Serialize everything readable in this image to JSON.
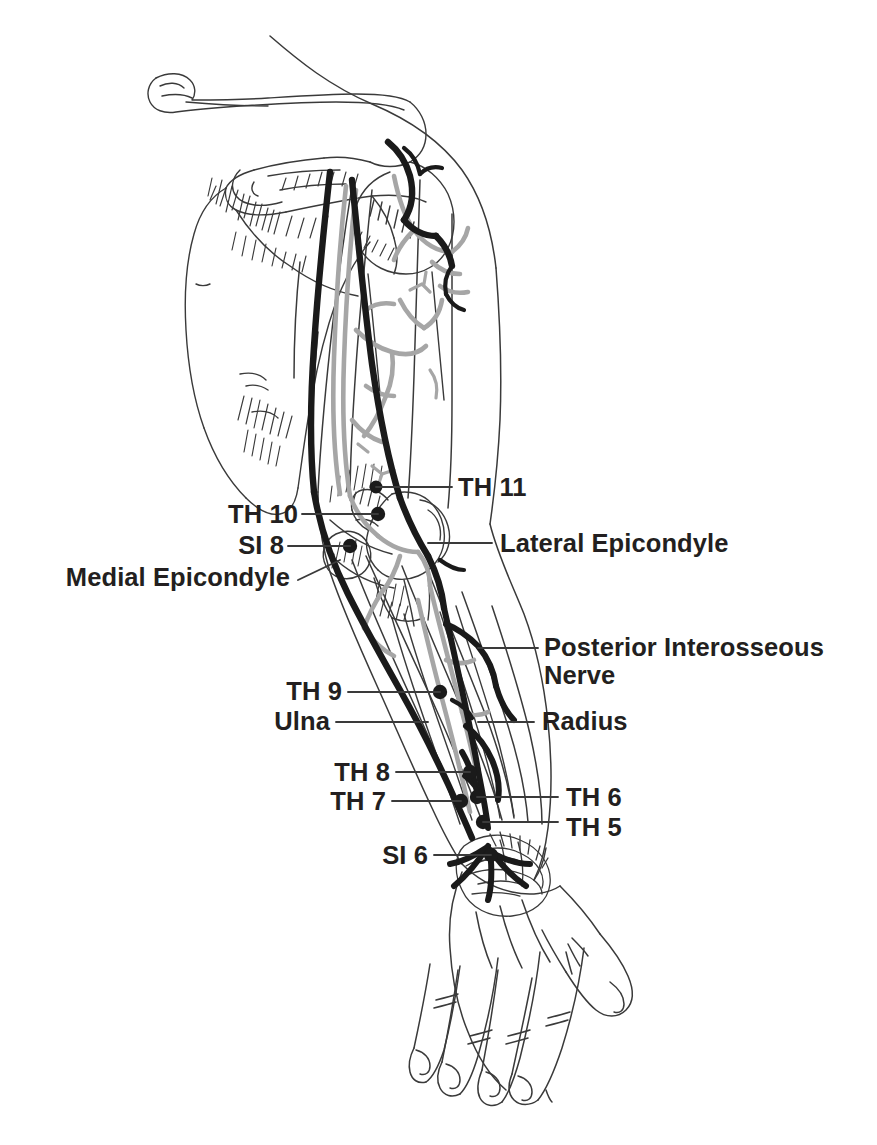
{
  "figure": {
    "view": "posterior",
    "colors": {
      "outline": "#3a3a3a",
      "nerve": "#1a1a1a",
      "vessel": "#a6a6a6",
      "text": "#231f20",
      "leader": "#3a3a3a",
      "background": "#ffffff"
    }
  },
  "labels": {
    "th11": "TH 11",
    "th10": "TH 10",
    "si8": "SI 8",
    "medial_epicondyle": "Medial Epicondyle",
    "lateral_epicondyle": "Lateral Epicondyle",
    "posterior_interosseous_nerve_line1": "Posterior Interosseous",
    "posterior_interosseous_nerve_line2": "Nerve",
    "th9": "TH 9",
    "ulna": "Ulna",
    "radius": "Radius",
    "th8": "TH 8",
    "th7": "TH 7",
    "th6": "TH 6",
    "th5": "TH 5",
    "si6": "SI 6"
  },
  "points": [
    {
      "id": "TH 11",
      "label": "TH 11",
      "x": 376,
      "y": 487,
      "side": "right"
    },
    {
      "id": "TH 10",
      "label": "TH 10",
      "x": 378,
      "y": 514,
      "side": "left"
    },
    {
      "id": "SI 8",
      "label": "SI 8",
      "x": 350,
      "y": 546,
      "side": "left"
    },
    {
      "id": "TH 9",
      "label": "TH 9",
      "x": 440,
      "y": 692,
      "side": "left"
    },
    {
      "id": "TH 8",
      "label": "TH 8",
      "x": 470,
      "y": 772,
      "side": "left"
    },
    {
      "id": "TH 7",
      "label": "TH 7",
      "x": 461,
      "y": 801,
      "side": "left"
    },
    {
      "id": "TH 6",
      "label": "TH 6",
      "x": 477,
      "y": 797,
      "side": "right"
    },
    {
      "id": "TH 5",
      "label": "TH 5",
      "x": 483,
      "y": 822,
      "side": "right"
    },
    {
      "id": "SI 6",
      "label": "SI 6",
      "x": 491,
      "y": 855,
      "side": "left"
    }
  ],
  "structures": [
    "Clavicle",
    "Scapula",
    "Acromion",
    "Humerus",
    "Olecranon",
    "Medial Epicondyle",
    "Lateral Epicondyle",
    "Ulna",
    "Radius",
    "Carpal bones",
    "Metacarpals",
    "Phalanges"
  ],
  "nerves": [
    "Radial Nerve",
    "Posterior Interosseous Nerve"
  ]
}
